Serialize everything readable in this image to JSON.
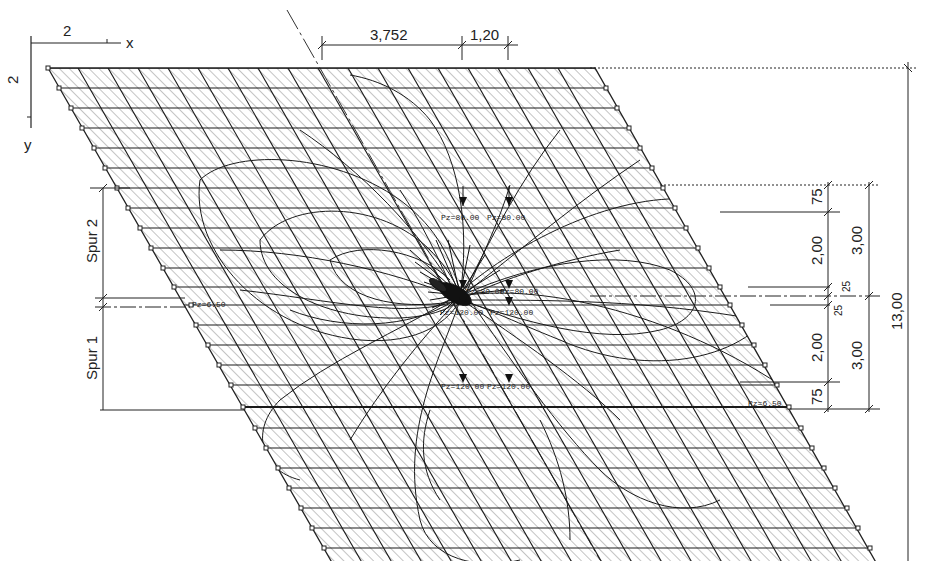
{
  "diagram": {
    "type": "skew plate finite element grid with influence lines",
    "colors": {
      "ink": "#1a1a1a",
      "hatch": "#8a8a8a",
      "background": "#ffffff"
    },
    "axes": {
      "x_label": "x",
      "y_label": "y",
      "x_scale_label": "2",
      "y_scale_label": "2"
    },
    "top_dimensions": [
      {
        "label": "3,752"
      },
      {
        "label": "1,20"
      }
    ],
    "left_lanes": [
      {
        "label": "Spur 2"
      },
      {
        "label": "Spur 1"
      }
    ],
    "right_dimensions": {
      "inner": [
        {
          "label": "75"
        },
        {
          "label": "2,00"
        },
        {
          "label": "25"
        },
        {
          "label": "25"
        },
        {
          "label": "2,00"
        },
        {
          "label": "75"
        }
      ],
      "middle": [
        {
          "label": "3,00"
        },
        {
          "label": "3,00"
        }
      ],
      "total": {
        "label": "13,00"
      }
    },
    "loads": [
      {
        "label": "Pz=80.00"
      },
      {
        "label": "Pz=80.00"
      },
      {
        "label": "Pz=80.00"
      },
      {
        "label": "Pz=80.00"
      },
      {
        "label": "Pz=120.00"
      },
      {
        "label": "Pz=120.00"
      },
      {
        "label": "Pz=120.00"
      },
      {
        "label": "Pz=120.00"
      }
    ],
    "edge_loads": [
      {
        "label": "Pz=6.50"
      },
      {
        "label": "Pz=6.50"
      }
    ]
  }
}
